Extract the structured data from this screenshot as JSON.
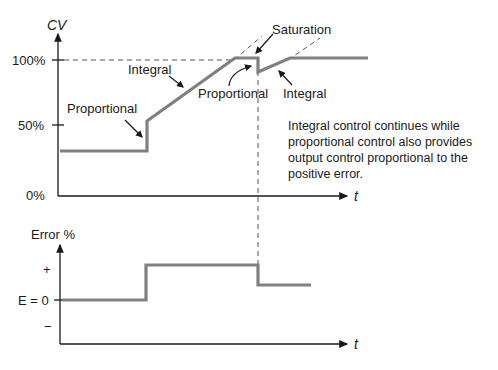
{
  "top_chart": {
    "y_label": "CV",
    "x_label": "t",
    "ticks": [
      "100%",
      "50%",
      "0%"
    ],
    "annotations": {
      "proportional_left": "Proportional",
      "integral_left": "Integral",
      "saturation": "Saturation",
      "proportional_right": "Proportional",
      "integral_right": "Integral"
    },
    "note": "Integral control continues while proportional control also provides output control proportional to the positive error."
  },
  "bottom_chart": {
    "y_label": "Error %",
    "x_label": "t",
    "ticks": {
      "plus": "+",
      "zero": "E = 0",
      "minus": "−"
    }
  },
  "colors": {
    "curve": "#808080",
    "axis": "#1a1a1a",
    "dashed": "#555555"
  }
}
